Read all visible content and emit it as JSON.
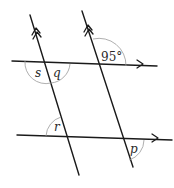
{
  "diagram": {
    "type": "parallel-lines-transversals",
    "lines": [
      {
        "name": "transversal-left",
        "marker": "double-arrow",
        "from": [
          30,
          15
        ],
        "to": [
          79,
          175
        ]
      },
      {
        "name": "transversal-right",
        "marker": "double-arrow",
        "from": [
          82,
          11
        ],
        "to": [
          133,
          167
        ]
      },
      {
        "name": "horizontal-top",
        "marker": "single-arrow",
        "from": [
          12,
          61
        ],
        "to": [
          157,
          66
        ]
      },
      {
        "name": "horizontal-bottom",
        "marker": "single-arrow",
        "from": [
          17,
          135
        ],
        "to": [
          172,
          140
        ]
      }
    ],
    "angles": [
      {
        "id": "given",
        "label": "95°",
        "position": "top-right intersection, upper-right angle"
      },
      {
        "id": "s",
        "label": "s",
        "position": "top-left intersection, lower-left angle"
      },
      {
        "id": "q",
        "label": "q",
        "position": "top-left intersection, lower-right angle"
      },
      {
        "id": "r",
        "label": "r",
        "position": "bottom-left intersection, upper-left angle"
      },
      {
        "id": "p",
        "label": "p",
        "position": "bottom-right intersection, lower-right angle"
      }
    ]
  }
}
